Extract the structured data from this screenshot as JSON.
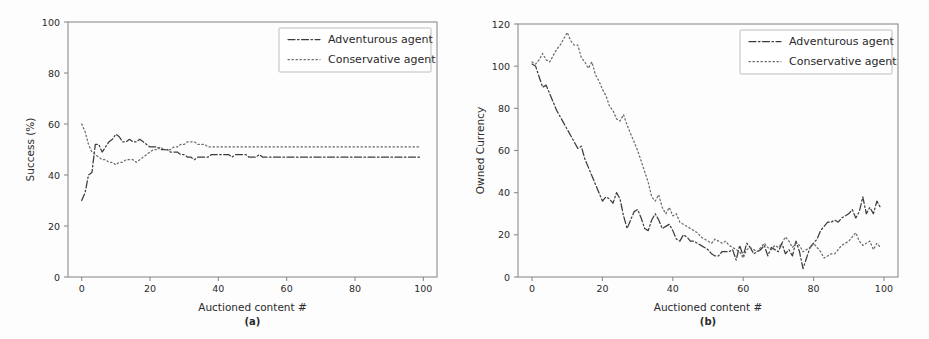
{
  "figure": {
    "background": "#fdfdfd",
    "accent": "#3c3c3c",
    "secondary": "#6b6b6b"
  },
  "chart_data": [
    {
      "type": "line",
      "panel_id": "a",
      "caption": "(a)",
      "title": "",
      "xlabel": "Auctioned content #",
      "ylabel": "Success (%)",
      "xlim": [
        -4,
        104
      ],
      "ylim": [
        0,
        100
      ],
      "xticks": [
        0,
        20,
        40,
        60,
        80,
        100
      ],
      "yticks": [
        0,
        20,
        40,
        60,
        80,
        100
      ],
      "grid": false,
      "legend_position": "upper right",
      "legend": [
        "Adventurous agent",
        "Conservative agent"
      ],
      "x": [
        0,
        1,
        2,
        3,
        4,
        5,
        6,
        7,
        8,
        9,
        10,
        11,
        12,
        13,
        14,
        15,
        16,
        17,
        18,
        19,
        20,
        21,
        22,
        23,
        24,
        25,
        26,
        27,
        28,
        29,
        30,
        31,
        32,
        33,
        34,
        35,
        36,
        37,
        38,
        39,
        40,
        41,
        42,
        43,
        44,
        45,
        46,
        47,
        48,
        49,
        50,
        51,
        52,
        53,
        54,
        55,
        56,
        57,
        58,
        59,
        60,
        61,
        62,
        63,
        64,
        65,
        66,
        67,
        68,
        69,
        70,
        71,
        72,
        73,
        74,
        75,
        76,
        77,
        78,
        79,
        80,
        81,
        82,
        83,
        84,
        85,
        86,
        87,
        88,
        89,
        90,
        91,
        92,
        93,
        94,
        95,
        96,
        97,
        98,
        99
      ],
      "series": [
        {
          "name": "Adventurous agent",
          "style": "dashdot",
          "values": [
            30,
            33,
            40,
            41,
            52,
            52,
            49,
            51,
            53,
            54,
            56,
            55,
            53,
            53,
            54,
            53,
            53,
            54,
            53,
            52,
            51,
            51,
            51,
            50,
            50,
            50,
            49,
            49,
            49,
            48,
            48,
            47,
            47,
            46,
            47,
            47,
            47,
            47,
            48,
            48,
            48,
            48,
            48,
            48,
            47,
            48,
            48,
            48,
            48,
            47,
            47,
            47,
            48,
            47,
            47,
            47,
            47,
            47,
            47,
            47,
            47,
            47,
            47,
            47,
            47,
            47,
            47,
            47,
            47,
            47,
            47,
            47,
            47,
            47,
            47,
            47,
            47,
            47,
            47,
            47,
            47,
            47,
            47,
            47,
            47,
            47,
            47,
            47,
            47,
            47,
            47,
            47,
            47,
            47,
            47,
            47,
            47,
            47,
            47,
            47
          ]
        },
        {
          "name": "Conservative agent",
          "style": "dotted",
          "values": [
            60,
            57,
            52,
            49,
            48,
            47,
            46,
            46,
            45,
            45,
            44,
            45,
            45,
            46,
            46,
            46,
            45,
            46,
            47,
            48,
            49,
            50,
            50,
            51,
            50,
            50,
            50,
            51,
            51,
            52,
            52,
            53,
            53,
            53,
            52,
            52,
            52,
            51,
            51,
            51,
            51,
            51,
            51,
            51,
            51,
            51,
            51,
            51,
            51,
            51,
            51,
            51,
            51,
            51,
            51,
            51,
            51,
            51,
            51,
            51,
            51,
            51,
            51,
            51,
            51,
            51,
            51,
            51,
            51,
            51,
            51,
            51,
            51,
            51,
            51,
            51,
            51,
            51,
            51,
            51,
            51,
            51,
            51,
            51,
            51,
            51,
            51,
            51,
            51,
            51,
            51,
            51,
            51,
            51,
            51,
            51,
            51,
            51,
            51,
            51
          ]
        }
      ]
    },
    {
      "type": "line",
      "panel_id": "b",
      "caption": "(b)",
      "title": "",
      "xlabel": "Auctioned content #",
      "ylabel": "Owned Currency",
      "xlim": [
        -4,
        104
      ],
      "ylim": [
        0,
        120
      ],
      "xticks": [
        0,
        20,
        40,
        60,
        80,
        100
      ],
      "yticks": [
        0,
        20,
        40,
        60,
        80,
        100,
        120
      ],
      "grid": false,
      "legend_position": "upper right",
      "legend": [
        "Adventurous agent",
        "Conservative agent"
      ],
      "x": [
        0,
        1,
        2,
        3,
        4,
        5,
        6,
        7,
        8,
        9,
        10,
        11,
        12,
        13,
        14,
        15,
        16,
        17,
        18,
        19,
        20,
        21,
        22,
        23,
        24,
        25,
        26,
        27,
        28,
        29,
        30,
        31,
        32,
        33,
        34,
        35,
        36,
        37,
        38,
        39,
        40,
        41,
        42,
        43,
        44,
        45,
        46,
        47,
        48,
        49,
        50,
        51,
        52,
        53,
        54,
        55,
        56,
        57,
        58,
        59,
        60,
        61,
        62,
        63,
        64,
        65,
        66,
        67,
        68,
        69,
        70,
        71,
        72,
        73,
        74,
        75,
        76,
        77,
        78,
        79,
        80,
        81,
        82,
        83,
        84,
        85,
        86,
        87,
        88,
        89,
        90,
        91,
        92,
        93,
        94,
        95,
        96,
        97,
        98,
        99
      ],
      "series": [
        {
          "name": "Adventurous agent",
          "style": "dashdot",
          "values": [
            101,
            100,
            95,
            90,
            91,
            87,
            83,
            79,
            76,
            73,
            70,
            67,
            64,
            61,
            62,
            56,
            52,
            48,
            44,
            40,
            36,
            38,
            37,
            35,
            40,
            37,
            29,
            23,
            27,
            31,
            32,
            28,
            23,
            22,
            27,
            30,
            27,
            23,
            24,
            25,
            22,
            18,
            17,
            20,
            19,
            17,
            17,
            16,
            15,
            14,
            13,
            11,
            10,
            10,
            12,
            12,
            12,
            13,
            8,
            15,
            10,
            16,
            14,
            11,
            12,
            13,
            15,
            10,
            14,
            13,
            12,
            16,
            11,
            13,
            10,
            17,
            12,
            4,
            9,
            14,
            16,
            18,
            22,
            24,
            26,
            26,
            27,
            26,
            28,
            29,
            30,
            32,
            28,
            31,
            38,
            30,
            33,
            30,
            36,
            33
          ]
        },
        {
          "name": "Conservative agent",
          "style": "dotted",
          "values": [
            102,
            101,
            103,
            106,
            103,
            102,
            105,
            108,
            110,
            113,
            116,
            112,
            110,
            110,
            104,
            102,
            99,
            102,
            96,
            93,
            89,
            86,
            81,
            79,
            75,
            74,
            77,
            72,
            68,
            64,
            60,
            55,
            50,
            45,
            38,
            36,
            39,
            33,
            30,
            33,
            29,
            30,
            26,
            25,
            24,
            23,
            22,
            21,
            19,
            18,
            17,
            16,
            18,
            17,
            16,
            17,
            15,
            14,
            13,
            12,
            9,
            13,
            14,
            13,
            12,
            14,
            16,
            14,
            13,
            15,
            14,
            16,
            19,
            17,
            14,
            16,
            15,
            12,
            13,
            14,
            16,
            14,
            12,
            9,
            10,
            11,
            11,
            13,
            15,
            16,
            17,
            19,
            21,
            17,
            15,
            16,
            17,
            13,
            16,
            14
          ]
        }
      ]
    }
  ]
}
